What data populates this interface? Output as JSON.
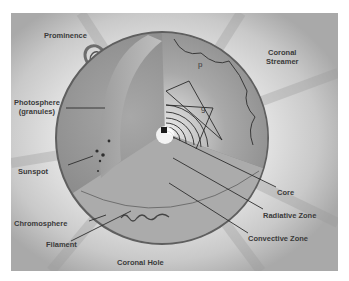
{
  "diagram": {
    "labels": {
      "prominence": "Prominence",
      "coronal_streamer_1": "Coronal",
      "coronal_streamer_2": "Streamer",
      "photosphere_1": "Photosphere",
      "photosphere_2": "(granules)",
      "sunspot": "Sunspot",
      "chromosphere": "Chromosphere",
      "filament": "Filament",
      "coronal_hole": "Coronal Hole",
      "core": "Core",
      "radiative_zone": "Radiative Zone",
      "convective_zone": "Convective Zone",
      "p_mode": "p",
      "g_mode": "g"
    },
    "colors": {
      "background": "#e4e4e4",
      "sphere_surface": "#8a8a8a",
      "cutaway": "#b5b5b5",
      "core": "#f4f4f4",
      "label_text": "#3a3a3a",
      "leader_line": "#2e2e2e"
    }
  }
}
